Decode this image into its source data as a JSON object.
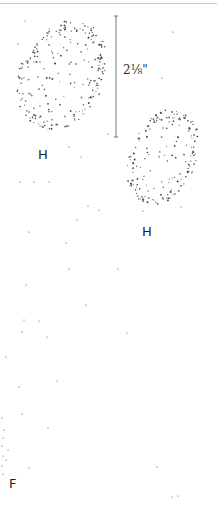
{
  "figure": {
    "measurement_label": "2⅛\"",
    "labels": [
      {
        "text": "H",
        "x": 38,
        "y": 148
      },
      {
        "text": "H",
        "x": 142,
        "y": 225
      },
      {
        "text": "F",
        "x": 9,
        "y": 477
      }
    ],
    "dimension_line": {
      "x": 116,
      "y1": 16,
      "y2": 137,
      "color": "#777777"
    },
    "shapes": [
      {
        "name": "stippled-shape-upper-left",
        "cx": 62,
        "cy": 75,
        "rx": 42,
        "ry": 58,
        "rotate": 25,
        "count": 230
      },
      {
        "name": "stippled-shape-right",
        "cx": 163,
        "cy": 157,
        "rx": 33,
        "ry": 50,
        "rotate": 22,
        "count": 180
      }
    ],
    "scattered_dots": [
      [
        25,
        21
      ],
      [
        18,
        44
      ],
      [
        173,
        32
      ],
      [
        162,
        78
      ],
      [
        108,
        134
      ],
      [
        69,
        147
      ],
      [
        81,
        157
      ],
      [
        20,
        182
      ],
      [
        34,
        182
      ],
      [
        49,
        182
      ],
      [
        88,
        206
      ],
      [
        99,
        210
      ],
      [
        77,
        220
      ],
      [
        29,
        232
      ],
      [
        66,
        243
      ],
      [
        69,
        269
      ],
      [
        118,
        269
      ],
      [
        26,
        285
      ],
      [
        86,
        305
      ],
      [
        24,
        320
      ],
      [
        39,
        321
      ],
      [
        22,
        332
      ],
      [
        47,
        337
      ],
      [
        127,
        333
      ],
      [
        6,
        357
      ],
      [
        57,
        381
      ],
      [
        19,
        387
      ],
      [
        22,
        414
      ],
      [
        48,
        428
      ],
      [
        2,
        418
      ],
      [
        4,
        430
      ],
      [
        3,
        438
      ],
      [
        2,
        446
      ],
      [
        8,
        450
      ],
      [
        3,
        456
      ],
      [
        6,
        460
      ],
      [
        2,
        466
      ],
      [
        3,
        474
      ],
      [
        29,
        468
      ],
      [
        157,
        467
      ],
      [
        172,
        497
      ],
      [
        178,
        496
      ],
      [
        181,
        207
      ],
      [
        143,
        211
      ]
    ]
  }
}
